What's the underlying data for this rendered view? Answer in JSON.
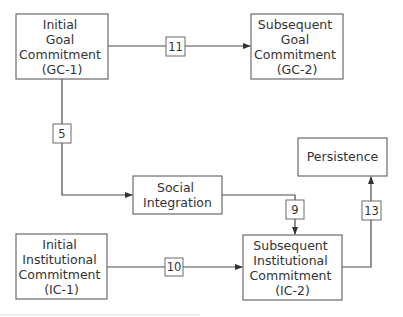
{
  "diagram": {
    "nodes": [
      {
        "id": "gc1",
        "lines": [
          "Initial",
          "Goal",
          "Commitment",
          "(GC-1)"
        ]
      },
      {
        "id": "gc2",
        "lines": [
          "Subsequent",
          "Goal",
          "Commitment",
          "(GC-2)"
        ]
      },
      {
        "id": "social",
        "lines": [
          "Social",
          "Integration"
        ]
      },
      {
        "id": "persistence",
        "lines": [
          "Persistence"
        ]
      },
      {
        "id": "ic1",
        "lines": [
          "Initial",
          "Institutional",
          "Commitment",
          "(IC-1)"
        ]
      },
      {
        "id": "ic2",
        "lines": [
          "Subsequent",
          "Institutional",
          "Commitment",
          "(IC-2)"
        ]
      }
    ],
    "edges": [
      {
        "id": "e11",
        "from": "gc1",
        "to": "gc2",
        "label": "11"
      },
      {
        "id": "e5",
        "from": "gc1",
        "to": "social",
        "label": "5"
      },
      {
        "id": "e9",
        "from": "social",
        "to": "ic2",
        "label": "9"
      },
      {
        "id": "e10",
        "from": "ic1",
        "to": "ic2",
        "label": "10"
      },
      {
        "id": "e13",
        "from": "ic2",
        "to": "persistence",
        "label": "13"
      }
    ]
  }
}
